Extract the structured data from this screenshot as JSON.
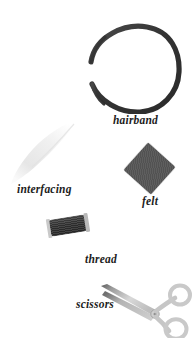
{
  "scene": {
    "background_color": "#ffffff",
    "width": 193,
    "height": 338
  },
  "items": [
    {
      "id": "hairband",
      "label": "hairband",
      "icon": "hairband-ring-icon",
      "color": "#3a3a3a",
      "shape": "open tapered ring"
    },
    {
      "id": "interfacing",
      "label": "interfacing",
      "icon": "interfacing-sheet-icon",
      "color": "#f2f2f2",
      "shape": "pale diagonal streak"
    },
    {
      "id": "felt",
      "label": "felt",
      "icon": "felt-square-icon",
      "color": "#565656",
      "shape": "rotated square"
    },
    {
      "id": "thread",
      "label": "thread",
      "icon": "thread-spool-icon",
      "color": "#333333",
      "shape": "spool"
    },
    {
      "id": "scissors",
      "label": "scissors",
      "icon": "scissors-icon",
      "color": "#c4c4c4",
      "shape": "scissors with two ring handles"
    }
  ]
}
